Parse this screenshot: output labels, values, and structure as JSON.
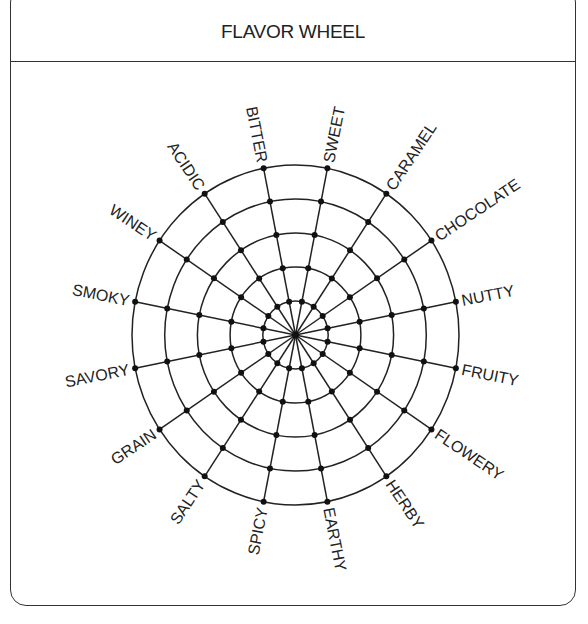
{
  "header": {
    "title": "FLAVOR WHEEL"
  },
  "wheel": {
    "center": {
      "x": 295.5,
      "y": 335
    },
    "radius": {
      "x": 163.5,
      "y": 170
    },
    "rings": 5,
    "start_angle_deg": -11.25,
    "line_color": "#222222",
    "labels": [
      "BITTER",
      "SWEET",
      "CARAMEL",
      "CHOCOLATE",
      "NUTTY",
      "FRUITY",
      "FLOWERY",
      "HERBY",
      "EARTHY",
      "SPICY",
      "SALTY",
      "GRAIN",
      "SAVORY",
      "SMOKY",
      "WINEY",
      "ACIDIC"
    ]
  }
}
